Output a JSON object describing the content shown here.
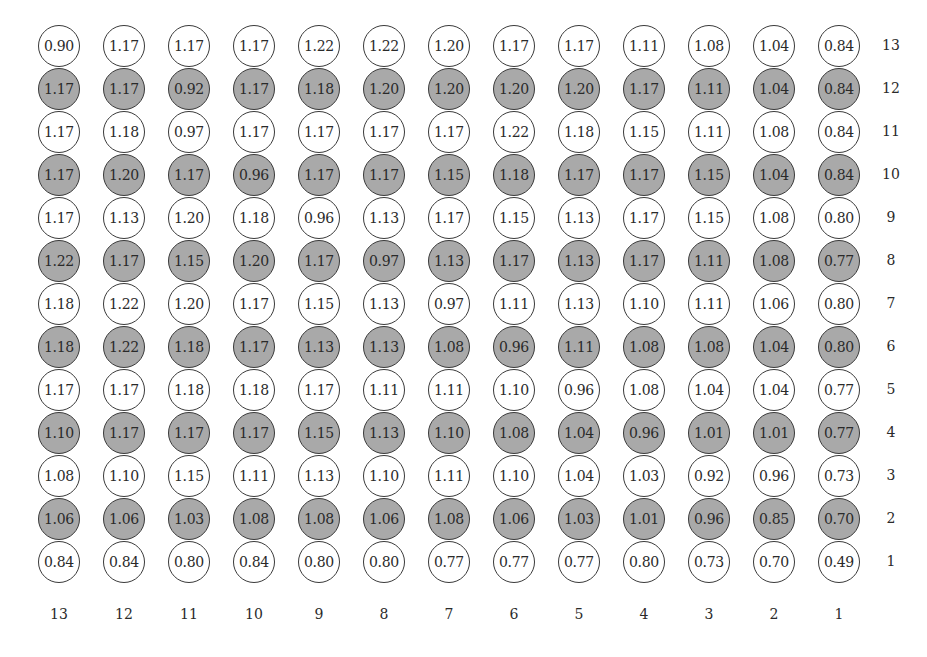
{
  "chart_data": {
    "type": "table",
    "title": "",
    "column_labels": [
      "13",
      "12",
      "11",
      "10",
      "9",
      "8",
      "7",
      "6",
      "5",
      "4",
      "3",
      "2",
      "1"
    ],
    "row_labels": [
      "13",
      "12",
      "11",
      "10",
      "9",
      "8",
      "7",
      "6",
      "5",
      "4",
      "3",
      "2",
      "1"
    ],
    "shaded_rows": [
      "12",
      "10",
      "8",
      "6",
      "4",
      "2"
    ],
    "colors": {
      "shaded": "#a9a9a9",
      "unshaded": "#ffffff",
      "border": "#3a3a3a"
    },
    "rows": [
      {
        "row": "13",
        "shaded": false,
        "values": [
          "0.90",
          "1.17",
          "1.17",
          "1.17",
          "1.22",
          "1.22",
          "1.20",
          "1.17",
          "1.17",
          "1.11",
          "1.08",
          "1.04",
          "0.84"
        ]
      },
      {
        "row": "12",
        "shaded": true,
        "values": [
          "1.17",
          "1.17",
          "0.92",
          "1.17",
          "1.18",
          "1.20",
          "1.20",
          "1.20",
          "1.20",
          "1.17",
          "1.11",
          "1.04",
          "0.84"
        ]
      },
      {
        "row": "11",
        "shaded": false,
        "values": [
          "1.17",
          "1.18",
          "0.97",
          "1.17",
          "1.17",
          "1.17",
          "1.17",
          "1.22",
          "1.18",
          "1.15",
          "1.11",
          "1.08",
          "0.84"
        ]
      },
      {
        "row": "10",
        "shaded": true,
        "values": [
          "1.17",
          "1.20",
          "1.17",
          "0.96",
          "1.17",
          "1.17",
          "1.15",
          "1.18",
          "1.17",
          "1.17",
          "1.15",
          "1.04",
          "0.84"
        ]
      },
      {
        "row": "9",
        "shaded": false,
        "values": [
          "1.17",
          "1.13",
          "1.20",
          "1.18",
          "0.96",
          "1.13",
          "1.17",
          "1.15",
          "1.13",
          "1.17",
          "1.15",
          "1.08",
          "0.80"
        ]
      },
      {
        "row": "8",
        "shaded": true,
        "values": [
          "1.22",
          "1.17",
          "1.15",
          "1.20",
          "1.17",
          "0.97",
          "1.13",
          "1.17",
          "1.13",
          "1.17",
          "1.11",
          "1.08",
          "0.77"
        ]
      },
      {
        "row": "7",
        "shaded": false,
        "values": [
          "1.18",
          "1.22",
          "1.20",
          "1.17",
          "1.15",
          "1.13",
          "0.97",
          "1.11",
          "1.13",
          "1.10",
          "1.11",
          "1.06",
          "0.80"
        ]
      },
      {
        "row": "6",
        "shaded": true,
        "values": [
          "1.18",
          "1.22",
          "1.18",
          "1.17",
          "1.13",
          "1.13",
          "1.08",
          "0.96",
          "1.11",
          "1.08",
          "1.08",
          "1.04",
          "0.80"
        ]
      },
      {
        "row": "5",
        "shaded": false,
        "values": [
          "1.17",
          "1.17",
          "1.18",
          "1.18",
          "1.17",
          "1.11",
          "1.11",
          "1.10",
          "0.96",
          "1.08",
          "1.04",
          "1.04",
          "0.77"
        ]
      },
      {
        "row": "4",
        "shaded": true,
        "values": [
          "1.10",
          "1.17",
          "1.17",
          "1.17",
          "1.15",
          "1.13",
          "1.10",
          "1.08",
          "1.04",
          "0.96",
          "1.01",
          "1.01",
          "0.77"
        ]
      },
      {
        "row": "3",
        "shaded": false,
        "values": [
          "1.08",
          "1.10",
          "1.15",
          "1.11",
          "1.13",
          "1.10",
          "1.11",
          "1.10",
          "1.04",
          "1.03",
          "0.92",
          "0.96",
          "0.73"
        ]
      },
      {
        "row": "2",
        "shaded": true,
        "values": [
          "1.06",
          "1.06",
          "1.03",
          "1.08",
          "1.08",
          "1.06",
          "1.08",
          "1.06",
          "1.03",
          "1.01",
          "0.96",
          "0.85",
          "0.70"
        ]
      },
      {
        "row": "1",
        "shaded": false,
        "values": [
          "0.84",
          "0.84",
          "0.80",
          "0.84",
          "0.80",
          "0.80",
          "0.77",
          "0.77",
          "0.77",
          "0.80",
          "0.73",
          "0.70",
          "0.49"
        ]
      }
    ]
  }
}
